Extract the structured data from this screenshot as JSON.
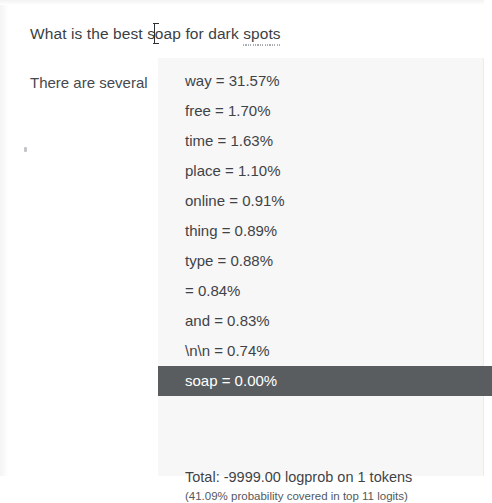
{
  "prompt": {
    "before_caret": "What is the best s",
    "after_caret": "oap for dark ",
    "misspelled_word": "spots"
  },
  "completion": {
    "text": "There are several"
  },
  "logits_panel": {
    "tokens": [
      {
        "token": "way",
        "value": "31.57%",
        "label": "way = 31.57%",
        "selected": false
      },
      {
        "token": "free",
        "value": "1.70%",
        "label": "free = 1.70%",
        "selected": false
      },
      {
        "token": "time",
        "value": "1.63%",
        "label": "time = 1.63%",
        "selected": false
      },
      {
        "token": "place",
        "value": "1.10%",
        "label": "place = 1.10%",
        "selected": false
      },
      {
        "token": "online",
        "value": "0.91%",
        "label": "online = 0.91%",
        "selected": false
      },
      {
        "token": "thing",
        "value": "0.89%",
        "label": "thing = 0.89%",
        "selected": false
      },
      {
        "token": "type",
        "value": "0.88%",
        "label": "type = 0.88%",
        "selected": false
      },
      {
        "token": "",
        "value": "0.84%",
        "label": "= 0.84%",
        "selected": false
      },
      {
        "token": "and",
        "value": "0.83%",
        "label": "and = 0.83%",
        "selected": false
      },
      {
        "token": "\\n\\n",
        "value": "0.74%",
        "label": "\\n\\n = 0.74%",
        "selected": false
      },
      {
        "token": "soap",
        "value": "0.00%",
        "label": "soap = 0.00%",
        "selected": true
      }
    ],
    "summary": {
      "total": "Total: -9999.00 logprob on 1 tokens",
      "coverage": "(41.09% probability covered in top 11 logits)"
    },
    "colors": {
      "panel_bg": "#f7f7f7",
      "selected_bg": "#5a5d60",
      "selected_text": "#ffffff",
      "text": "#3f4347"
    }
  }
}
